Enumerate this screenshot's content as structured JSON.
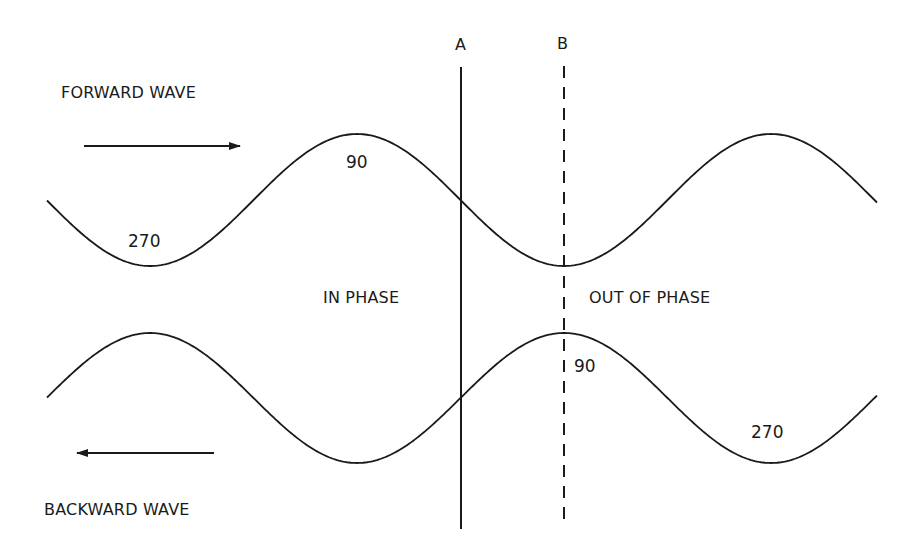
{
  "diagram": {
    "labels": {
      "forward_wave": "FORWARD WAVE",
      "backward_wave": "BACKWARD WAVE",
      "in_phase": "IN PHASE",
      "out_of_phase": "OUT OF PHASE",
      "marker_a": "A",
      "marker_b": "B"
    },
    "forward_wave": {
      "direction": "right",
      "phase_labels": {
        "trough": "270",
        "peak": "90"
      }
    },
    "backward_wave": {
      "direction": "left",
      "phase_labels": {
        "peak": "90",
        "trough": "270"
      }
    },
    "markers": [
      {
        "id": "A",
        "style": "solid",
        "meaning": "waves in phase"
      },
      {
        "id": "B",
        "style": "dashed",
        "meaning": "waves out of phase"
      }
    ],
    "colors": {
      "stroke": "#1a1a1a",
      "background": "#ffffff"
    }
  }
}
